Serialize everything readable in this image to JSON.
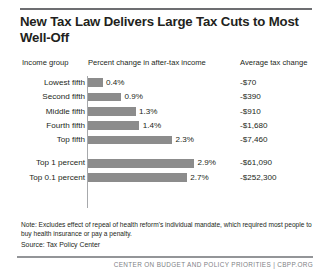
{
  "figure": {
    "title": "New Tax Law Delivers Large Tax Cuts to Most Well-Off",
    "note": "Note: Excludes effect of repeal of health reform's individual mandate, which required most people to buy health insurance or pay a penalty.",
    "source": "Source: Tax Policy Center",
    "footer": "CENTER ON BUDGET AND POLICY PRIORITIES | CBPP.ORG"
  },
  "headers": {
    "income_group": "Income group",
    "percent_change": "Percent change in after-tax income",
    "average_change": "Average tax change"
  },
  "chart_data": {
    "type": "bar",
    "title": "New Tax Law Delivers Large Tax Cuts to Most Well-Off",
    "xlabel": "Percent change in after-tax income",
    "ylabel": "Income group",
    "orientation": "horizontal",
    "grid": false,
    "legend": "none",
    "xlim": [
      0,
      3.2
    ],
    "categories": [
      "Lowest fifth",
      "Second fifth",
      "Middle fifth",
      "Fourth fifth",
      "Top fifth",
      "Top 1 percent",
      "Top 0.1 percent"
    ],
    "values": [
      0.4,
      0.9,
      1.3,
      1.4,
      2.3,
      2.9,
      2.7
    ],
    "value_labels": [
      "0.4%",
      "0.9%",
      "1.3%",
      "1.4%",
      "2.3%",
      "2.9%",
      "2.7%"
    ],
    "series": [
      {
        "name": "Percent change in after-tax income",
        "values": [
          0.4,
          0.9,
          1.3,
          1.4,
          2.3,
          2.9,
          2.7
        ],
        "color": "#8c8c8c"
      },
      {
        "name": "Average tax change",
        "values": [
          -70,
          -390,
          -910,
          -1680,
          -7460,
          -61090,
          -252300
        ],
        "labels": [
          "-$70",
          "-$390",
          "-$910",
          "-$1,680",
          "-$7,460",
          "-$61,090",
          "-$252,300"
        ]
      }
    ]
  },
  "rows": [
    {
      "label": "Lowest fifth",
      "pct_label": "0.4%",
      "pct": 0.4,
      "avg": "-$70"
    },
    {
      "label": "Second fifth",
      "pct_label": "0.9%",
      "pct": 0.9,
      "avg": "-$390"
    },
    {
      "label": "Middle fifth",
      "pct_label": "1.3%",
      "pct": 1.3,
      "avg": "-$910"
    },
    {
      "label": "Fourth fifth",
      "pct_label": "1.4%",
      "pct": 1.4,
      "avg": "-$1,680"
    },
    {
      "label": "Top fifth",
      "pct_label": "2.3%",
      "pct": 2.3,
      "avg": "-$7,460"
    },
    {
      "label": "Top 1 percent",
      "pct_label": "2.9%",
      "pct": 2.9,
      "avg": "-$61,090"
    },
    {
      "label": "Top 0.1 percent",
      "pct_label": "2.7%",
      "pct": 2.7,
      "avg": "-$252,300"
    }
  ],
  "colors": {
    "bar": "#8c8c8c",
    "rule": "#6d6e71",
    "text": "#231f20",
    "footer_text": "#808285"
  }
}
